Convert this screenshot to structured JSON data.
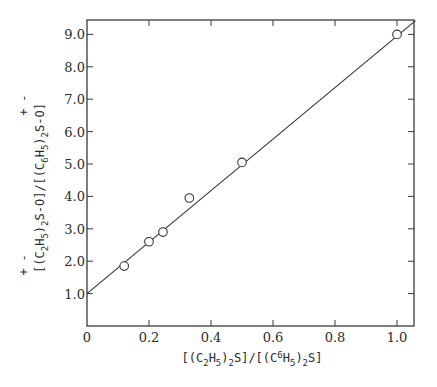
{
  "chart_data": {
    "type": "scatter",
    "title": "",
    "xlabel": "[(C2H5)2S]/[(C6H5)2S]",
    "ylabel": "[(C2H5)2S(+)-O(-)]/[(C6H5)2S(+)-O(-)]",
    "xlim": [
      0,
      1.05
    ],
    "ylim": [
      0,
      9.4
    ],
    "grid": false,
    "legend": null,
    "x_ticks": [
      0,
      0.2,
      0.4,
      0.6,
      0.8,
      1.0
    ],
    "x_tick_labels": [
      "0",
      "0.2",
      "0.4",
      "0.6",
      "0.8",
      "1.0"
    ],
    "y_ticks": [
      1.0,
      2.0,
      3.0,
      4.0,
      5.0,
      6.0,
      7.0,
      8.0,
      9.0
    ],
    "y_tick_labels": [
      "1.0",
      "2.0",
      "3.0",
      "4.0",
      "5.0",
      "6.0",
      "7.0",
      "8.0",
      "9.0"
    ],
    "series": [
      {
        "name": "measured",
        "marker": "open-circle",
        "x": [
          0.12,
          0.2,
          0.245,
          0.33,
          0.5,
          1.0
        ],
        "y": [
          1.85,
          2.6,
          2.9,
          3.95,
          5.05,
          9.0
        ]
      }
    ],
    "fit_line": {
      "name": "linear fit",
      "intercept": 1.0,
      "slope": 7.95,
      "x_range": [
        0,
        1.06
      ]
    }
  }
}
